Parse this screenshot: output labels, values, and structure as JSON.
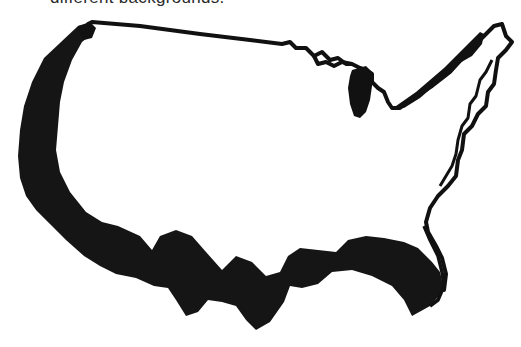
{
  "caption": {
    "text": "different backgrounds."
  },
  "map": {
    "subject": "United States outline map",
    "outline_color": "#111111",
    "fill_color": "#ffffff",
    "shadow_color": "#151515",
    "background_color": "#ffffff"
  }
}
